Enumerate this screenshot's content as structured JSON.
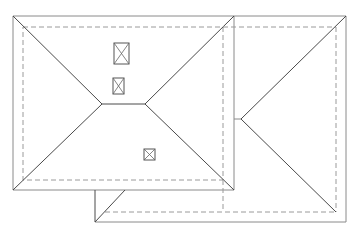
{
  "diagram": {
    "type": "roof-plan",
    "description": "Hip roof plan with attached hip wing and skylights",
    "colors": {
      "background": "#ffffff",
      "roof_edge": "#4a4a4a",
      "wall_line_dashed": "#9a9a9a"
    },
    "main_roof": {
      "outer": {
        "x1": 13,
        "y1": 16,
        "x2": 234,
        "y2": 190
      },
      "inner_wall_dashed": {
        "x1": 23,
        "y1": 27,
        "x2": 223,
        "y2": 180
      },
      "ridge": {
        "x1": 102,
        "y1": 104,
        "x2": 145,
        "y2": 104
      }
    },
    "wing_roof": {
      "outer": {
        "x1": 234,
        "y1": 16,
        "x2": 346,
        "y2": 222
      },
      "inner_wall_dashed": {
        "x1": 223,
        "y1": 27,
        "x2": 336,
        "y2": 212
      },
      "hip_apex": {
        "x": 241,
        "y": 119
      }
    },
    "lower_extension": {
      "outer": {
        "x1": 95,
        "y1": 190,
        "x2": 234,
        "y2": 222
      },
      "dashed_y": 212
    },
    "skylights": [
      {
        "label": "skylight-1",
        "x": 114,
        "y": 43,
        "w": 15,
        "h": 21
      },
      {
        "label": "skylight-2",
        "x": 113,
        "y": 78,
        "w": 11,
        "h": 16
      },
      {
        "label": "skylight-3",
        "x": 144,
        "y": 149,
        "w": 11,
        "h": 11
      }
    ]
  }
}
